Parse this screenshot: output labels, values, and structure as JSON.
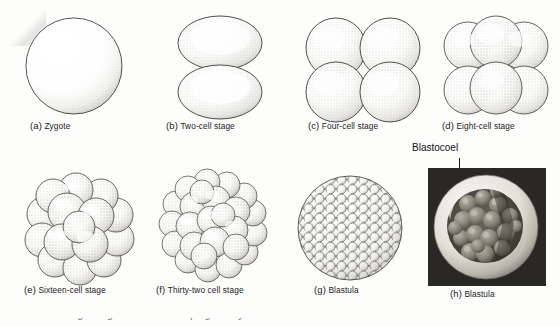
{
  "figure": {
    "background_color": "#fdfdfc",
    "ink_color": "#1a1a1a",
    "panels": [
      {
        "tag": "(a)",
        "label": "Zygote",
        "art": "single-sphere"
      },
      {
        "tag": "(b)",
        "label": "Two-cell stage",
        "art": "two-cell"
      },
      {
        "tag": "(c)",
        "label": "Four-cell stage",
        "art": "four-cell"
      },
      {
        "tag": "(d)",
        "label": "Eight-cell stage",
        "art": "eight-cell"
      },
      {
        "tag": "(e)",
        "label": "Sixteen-cell stage",
        "art": "sixteen-cell"
      },
      {
        "tag": "(f)",
        "label": "Thirty-two cell stage",
        "art": "thirtytwo-cell"
      },
      {
        "tag": "(g)",
        "label": "Blastula",
        "art": "blastula-drawing"
      },
      {
        "tag": "(h)",
        "label": "Blastula",
        "art": "blastula-micrograph"
      }
    ],
    "annotation": {
      "label": "Blastocoel",
      "points_to": "(h) Blastula"
    },
    "cutoff_line": "the cleavage stages of the developing embryo as the individual cells or blastomeres"
  }
}
